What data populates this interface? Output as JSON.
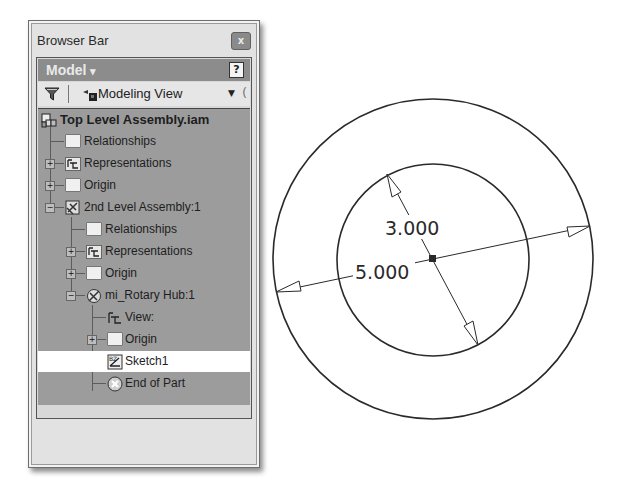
{
  "panel": {
    "title": "Browser Bar",
    "close_label": "x",
    "model_label": "Model",
    "model_dropdown": "▾",
    "help_label": "?",
    "toolbar": {
      "filter_icon": "filter-icon",
      "view_label": "Modeling View",
      "dropdown": "▼",
      "more": "("
    },
    "tree": [
      {
        "label": "Top Level Assembly.iam",
        "icon": "assembly-icon",
        "level": 0,
        "bold": true
      },
      {
        "label": "Relationships",
        "icon": "folder-icon",
        "level": 1
      },
      {
        "label": "Representations",
        "icon": "representations-icon",
        "level": 1,
        "expander": "+"
      },
      {
        "label": "Origin",
        "icon": "folder-icon",
        "level": 1,
        "expander": "+"
      },
      {
        "label": "2nd Level Assembly:1",
        "icon": "subassembly-icon",
        "level": 1,
        "expander": "−"
      },
      {
        "label": "Relationships",
        "icon": "folder-icon",
        "level": 2
      },
      {
        "label": "Representations",
        "icon": "representations-icon",
        "level": 2,
        "expander": "+"
      },
      {
        "label": "Origin",
        "icon": "folder-icon",
        "level": 2,
        "expander": "+"
      },
      {
        "label": "mi_Rotary Hub:1",
        "icon": "part-icon",
        "level": 2,
        "expander": "−"
      },
      {
        "label": "View:",
        "icon": "view-icon",
        "level": 3
      },
      {
        "label": "Origin",
        "icon": "folder-icon",
        "level": 3,
        "expander": "+"
      },
      {
        "label": "Sketch1",
        "icon": "sketch-icon",
        "level": 3,
        "selected": true
      },
      {
        "label": "End of Part",
        "icon": "end-of-part-icon",
        "level": 3
      }
    ]
  },
  "sketch": {
    "outer_diameter": "5.000",
    "inner_diameter": "3.000",
    "line_color": "#2a2a2a"
  }
}
